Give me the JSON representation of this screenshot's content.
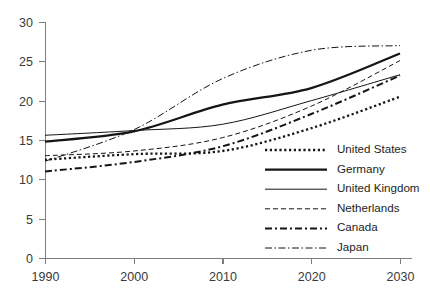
{
  "chart_data": {
    "type": "line",
    "title": "",
    "xlabel": "",
    "ylabel": "",
    "x": [
      1990,
      2000,
      2010,
      2020,
      2030
    ],
    "xlim": [
      1990,
      2030
    ],
    "ylim": [
      0,
      30
    ],
    "x_ticks": [
      "1990",
      "2000",
      "2010",
      "2020",
      "2030"
    ],
    "y_ticks": [
      "0",
      "5",
      "10",
      "15",
      "20",
      "25",
      "30"
    ],
    "grid": false,
    "legend_position": "inside-lower-right",
    "series": [
      {
        "name": "United States",
        "style": "dotted-thick",
        "values": [
          12.5,
          13.2,
          13.6,
          16.5,
          20.5
        ]
      },
      {
        "name": "Germany",
        "style": "solid-thick",
        "values": [
          14.8,
          16.1,
          19.5,
          21.6,
          26.0
        ]
      },
      {
        "name": "United Kingdom",
        "style": "solid-thin",
        "values": [
          15.6,
          16.2,
          17.0,
          20.0,
          23.3
        ]
      },
      {
        "name": "Netherlands",
        "style": "dashed-thin",
        "values": [
          13.0,
          13.6,
          15.3,
          19.3,
          25.1
        ]
      },
      {
        "name": "Canada",
        "style": "dashdot-thick",
        "values": [
          11.0,
          12.2,
          14.2,
          18.3,
          23.2
        ]
      },
      {
        "name": "Japan",
        "style": "dashdotdot-thin",
        "values": [
          12.3,
          16.3,
          22.8,
          26.4,
          27.0
        ]
      }
    ]
  },
  "legend": {
    "entries": [
      {
        "label": "United States"
      },
      {
        "label": "Germany"
      },
      {
        "label": "United Kingdom"
      },
      {
        "label": "Netherlands"
      },
      {
        "label": "Canada"
      },
      {
        "label": "Japan"
      }
    ]
  },
  "colors": {
    "ink": "#151515",
    "axis": "#7d7d7d",
    "tick_text": "#3a3a3a",
    "background": "#ffffff"
  }
}
